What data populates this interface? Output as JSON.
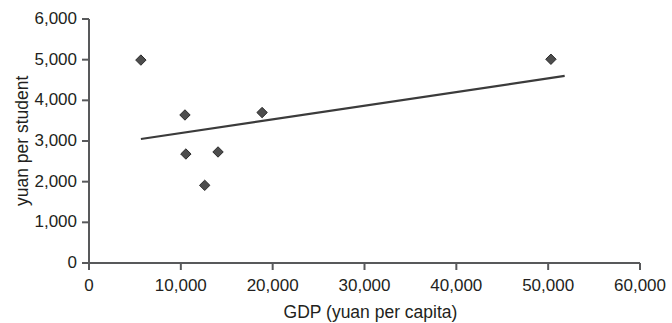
{
  "chart_data": {
    "type": "scatter",
    "title": "",
    "xlabel": "GDP (yuan per capita)",
    "ylabel": "yuan per student",
    "xlim": [
      0,
      60000
    ],
    "ylim": [
      0,
      6000
    ],
    "grid": false,
    "legend": null,
    "xticks": [
      "0",
      "10,000",
      "20,000",
      "30,000",
      "40,000",
      "50,000",
      "60,000"
    ],
    "xtick_values": [
      0,
      10000,
      20000,
      30000,
      40000,
      50000,
      60000
    ],
    "yticks": [
      "0",
      "1,000",
      "2,000",
      "3,000",
      "4,000",
      "5,000",
      "6,000"
    ],
    "ytick_values": [
      0,
      1000,
      2000,
      3000,
      4000,
      5000,
      6000
    ],
    "marker": "diamond",
    "marker_color": "#4d4d4d",
    "line_color": "#3b3b3b",
    "axis_color": "#58595b",
    "points": [
      {
        "x": 5650,
        "y": 4990
      },
      {
        "x": 10450,
        "y": 3640
      },
      {
        "x": 10550,
        "y": 2680
      },
      {
        "x": 12600,
        "y": 1910
      },
      {
        "x": 14050,
        "y": 2730
      },
      {
        "x": 18850,
        "y": 3700
      },
      {
        "x": 50300,
        "y": 5010
      }
    ],
    "trendline": {
      "type": "line",
      "x_start": 5650,
      "y_start": 3050,
      "x_end": 51800,
      "y_end": 4600
    }
  }
}
